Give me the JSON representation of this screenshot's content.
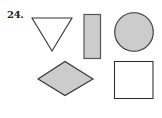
{
  "problem": {
    "number": "24."
  },
  "colors": {
    "stroke": "#333333",
    "fill_shaded": "#cccccc",
    "fill_empty": "#ffffff"
  },
  "shapes": [
    {
      "type": "triangle",
      "orientation": "pointing-down",
      "filled": false
    },
    {
      "type": "rectangle",
      "orientation": "vertical",
      "filled": true
    },
    {
      "type": "circle",
      "filled": true
    },
    {
      "type": "rhombus",
      "filled": true
    },
    {
      "type": "square",
      "filled": false
    }
  ]
}
